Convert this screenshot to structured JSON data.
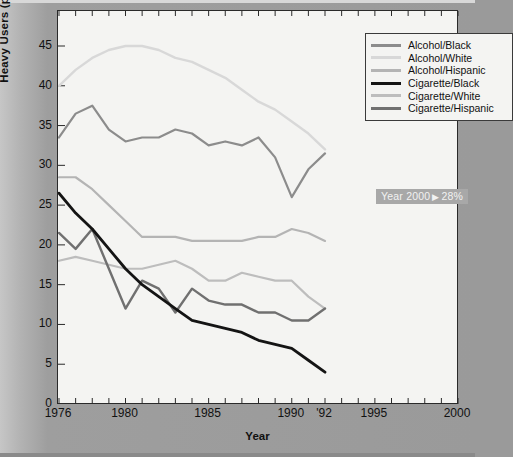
{
  "chart_data": {
    "type": "line",
    "title": "",
    "xlabel": "Year",
    "ylabel": "Heavy Users (percent)",
    "xlim": [
      1976,
      2000
    ],
    "ylim": [
      0,
      47
    ],
    "grid": false,
    "legend_position": "top-right",
    "x_ticks_labeled": [
      "1976",
      "1980",
      "1985",
      "1990",
      "'92",
      "1995",
      "2000"
    ],
    "x_ticks_labeled_values": [
      1976,
      1980,
      1985,
      1990,
      1992,
      1995,
      2000
    ],
    "y_ticks": [
      "0",
      "5",
      "10",
      "15",
      "20",
      "25",
      "30",
      "35",
      "40",
      "45"
    ],
    "y_tick_values": [
      0,
      5,
      10,
      15,
      20,
      25,
      30,
      35,
      40,
      45
    ],
    "x": [
      1976,
      1977,
      1978,
      1979,
      1980,
      1981,
      1982,
      1983,
      1984,
      1985,
      1986,
      1987,
      1988,
      1989,
      1990,
      1991,
      1992
    ],
    "series": [
      {
        "name": "Alcohol/Black",
        "color": "#8c8c8c",
        "width": 2.2,
        "values": [
          33.5,
          36.5,
          37.5,
          34.5,
          33.0,
          33.5,
          33.5,
          34.5,
          34.0,
          32.5,
          33.0,
          32.5,
          33.5,
          31.0,
          26.0,
          29.5,
          31.5
        ]
      },
      {
        "name": "Alcohol/White",
        "color": "#d8d8d8",
        "width": 2.4,
        "values": [
          40.0,
          42.0,
          43.5,
          44.5,
          45.0,
          45.0,
          44.5,
          43.5,
          43.0,
          42.0,
          41.0,
          39.5,
          38.0,
          37.0,
          35.5,
          34.0,
          32.0
        ]
      },
      {
        "name": "Alcohol/Hispanic",
        "color": "#b4b4b4",
        "width": 2.2,
        "values": [
          28.5,
          28.5,
          27.0,
          25.0,
          23.0,
          21.0,
          21.0,
          21.0,
          20.5,
          20.5,
          20.5,
          20.5,
          21.0,
          21.0,
          22.0,
          21.5,
          20.5
        ]
      },
      {
        "name": "Cigarette/Black",
        "color": "#141414",
        "width": 2.8,
        "values": [
          26.5,
          24.0,
          22.0,
          19.5,
          17.0,
          15.0,
          13.5,
          12.0,
          10.5,
          10.0,
          9.5,
          9.0,
          8.0,
          7.5,
          7.0,
          5.5,
          4.0
        ]
      },
      {
        "name": "Cigarette/White",
        "color": "#bdbdbd",
        "width": 2.2,
        "values": [
          18.0,
          18.5,
          18.0,
          17.5,
          17.0,
          17.0,
          17.5,
          18.0,
          17.0,
          15.5,
          15.5,
          16.5,
          16.0,
          15.5,
          15.5,
          13.5,
          12.0
        ]
      },
      {
        "name": "Cigarette/Hispanic",
        "color": "#707070",
        "width": 2.4,
        "values": [
          21.5,
          19.5,
          22.0,
          17.0,
          12.0,
          15.5,
          14.5,
          11.5,
          14.5,
          13.0,
          12.5,
          12.5,
          11.5,
          11.5,
          10.5,
          10.5,
          12.0
        ]
      }
    ],
    "annotations": [
      {
        "text_prefix": "Year 2000",
        "arrow": "▶",
        "text_value": "28%",
        "x": 2000,
        "y": 28
      }
    ]
  },
  "legend": {
    "items": [
      {
        "label": "Alcohol/Black"
      },
      {
        "label": "Alcohol/White"
      },
      {
        "label": "Alcohol/Hispanic"
      },
      {
        "label": "Cigarette/Black"
      },
      {
        "label": "Cigarette/White"
      },
      {
        "label": "Cigarette/Hispanic"
      }
    ]
  },
  "annotation_box": {
    "full_text": "Year 2000 ▶ 28%",
    "prefix": "Year 2000",
    "arrow": "▶",
    "value": "28%"
  },
  "colors": {
    "page_background": "#9a9a9a",
    "plot_background": "#f4f4f2",
    "axis": "#2a2a2a",
    "annotation_background": "#a8a8a8",
    "annotation_text": "#f2f2f2"
  }
}
